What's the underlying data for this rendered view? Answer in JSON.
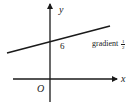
{
  "diagram": {
    "type": "cartesian-line-graph",
    "axes": {
      "x_label": "x",
      "y_label": "y",
      "origin_label": "O"
    },
    "line": {
      "y_intercept_label": "6",
      "annotation_prefix": "gradient",
      "gradient_numerator": "1",
      "gradient_denominator": "2"
    },
    "colors": {
      "ink": "#1a1a1a",
      "background": "#ffffff"
    }
  }
}
